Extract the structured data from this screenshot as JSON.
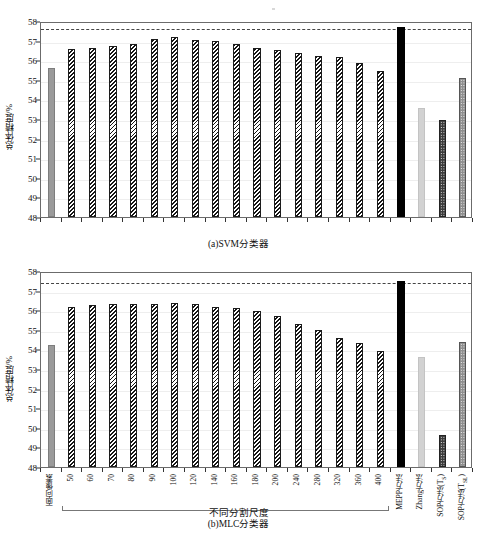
{
  "figure": {
    "ylabel": "总体精度/%",
    "group_label": "不同分割尺度",
    "caption_a": "(a)SVM分类器",
    "caption_b": "(b)MLC分类器",
    "yticks": [
      48,
      49,
      50,
      51,
      52,
      53,
      54,
      55,
      56,
      57,
      58
    ],
    "categories": [
      "面向像素",
      "50",
      "60",
      "70",
      "80",
      "90",
      "100",
      "120",
      "140",
      "160",
      "180",
      "200",
      "240",
      "280",
      "320",
      "360",
      "400",
      "MEPP方法",
      "Zhang方法",
      "SOP方法(Ts)",
      "SOP方法(TsL)"
    ],
    "category_labels_html": [
      "面向像素",
      "50",
      "60",
      "70",
      "80",
      "90",
      "100",
      "120",
      "140",
      "160",
      "180",
      "200",
      "240",
      "280",
      "320",
      "360",
      "400",
      "MEPP方法",
      "Zhang方法",
      "SOP方法(T<sub>S</sub>)",
      "SOP方法(T<sub>SL</sub>)"
    ],
    "styles": [
      "f-gray",
      "f-hatch",
      "f-hatch",
      "f-hatch",
      "f-hatch",
      "f-hatch",
      "f-hatch",
      "f-hatch",
      "f-hatch",
      "f-hatch",
      "f-hatch",
      "f-hatch",
      "f-hatch",
      "f-hatch",
      "f-hatch",
      "f-hatch",
      "f-hatch",
      "f-black",
      "f-ltgray",
      "f-dotdark",
      "f-dotgray"
    ],
    "colors": {
      "pixel_based": "#9a9a9a",
      "segmentation_scale": "#151515",
      "mepp": "#000000",
      "zhang": "#d2d2d2",
      "sop_ts": "#3c3c3c",
      "sop_tsl": "#8f8f8f",
      "axis": "#6b6b6b",
      "grid": "#eeeeee"
    }
  },
  "chart_data": [
    {
      "type": "bar",
      "id": "svm",
      "title": "(a)SVM分类器",
      "xlabel": "不同分割尺度",
      "ylabel": "总体精度/%",
      "ylim": [
        48,
        58
      ],
      "ytick_step": 1,
      "grid": true,
      "legend": "none",
      "reference_line": 57.68,
      "categories": [
        "面向像素",
        "50",
        "60",
        "70",
        "80",
        "90",
        "100",
        "120",
        "140",
        "160",
        "180",
        "200",
        "240",
        "280",
        "320",
        "360",
        "400",
        "MEPP方法",
        "Zhang方法",
        "SOP方法(Ts)",
        "SOP方法(TsL)"
      ],
      "values": [
        55.6,
        56.56,
        56.6,
        56.75,
        56.85,
        57.1,
        57.18,
        57.05,
        56.98,
        56.82,
        56.6,
        56.5,
        56.38,
        56.22,
        56.15,
        55.88,
        55.44,
        57.68,
        53.58,
        52.95,
        55.1
      ]
    },
    {
      "type": "bar",
      "id": "mlc",
      "title": "(b)MLC分类器",
      "xlabel": "不同分割尺度",
      "ylabel": "总体精度/%",
      "ylim": [
        48,
        58
      ],
      "ytick_step": 1,
      "grid": true,
      "legend": "none",
      "reference_line": 57.5,
      "categories": [
        "面向像素",
        "50",
        "60",
        "70",
        "80",
        "90",
        "100",
        "120",
        "140",
        "160",
        "180",
        "200",
        "240",
        "280",
        "320",
        "360",
        "400",
        "MEPP方法",
        "Zhang方法",
        "SOP方法(Ts)",
        "SOP方法(TsL)"
      ],
      "values": [
        54.2,
        56.18,
        56.28,
        56.3,
        56.3,
        56.3,
        56.38,
        56.3,
        56.18,
        56.1,
        55.95,
        55.72,
        55.32,
        55.0,
        54.6,
        54.32,
        53.92,
        57.5,
        53.6,
        49.62,
        54.38
      ]
    }
  ]
}
